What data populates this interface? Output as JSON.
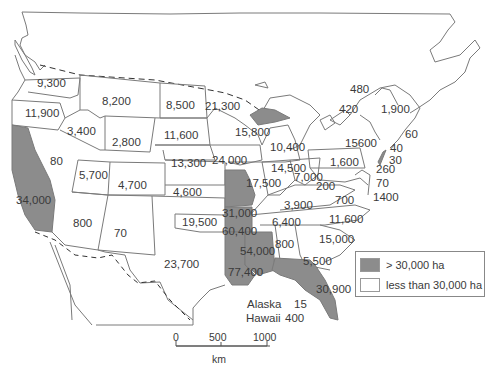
{
  "map": {
    "title": "",
    "colors": {
      "high": "#8c8c8c",
      "low": "#ffffff",
      "border": "#7a7a7a"
    },
    "state_values": [
      {
        "id": "wa",
        "value": "9,300",
        "x": 37,
        "y": 77
      },
      {
        "id": "or",
        "value": "11,900",
        "x": 25,
        "y": 107
      },
      {
        "id": "ca",
        "value": "34,000",
        "x": 16,
        "y": 194,
        "highlight": true
      },
      {
        "id": "id",
        "value": "3,400",
        "x": 67,
        "y": 125
      },
      {
        "id": "nv",
        "value": "80",
        "x": 50,
        "y": 155
      },
      {
        "id": "mt",
        "value": "8,200",
        "x": 102,
        "y": 95
      },
      {
        "id": "wy",
        "value": "2,800",
        "x": 112,
        "y": 136
      },
      {
        "id": "ut",
        "value": "5,700",
        "x": 79,
        "y": 169
      },
      {
        "id": "co",
        "value": "4,700",
        "x": 118,
        "y": 179
      },
      {
        "id": "az",
        "value": "800",
        "x": 73,
        "y": 217
      },
      {
        "id": "nm",
        "value": "70",
        "x": 114,
        "y": 227
      },
      {
        "id": "nd",
        "value": "8,500",
        "x": 166,
        "y": 99
      },
      {
        "id": "sd",
        "value": "11,600",
        "x": 164,
        "y": 129
      },
      {
        "id": "ne",
        "value": "13,300",
        "x": 171,
        "y": 157
      },
      {
        "id": "ks",
        "value": "4,600",
        "x": 173,
        "y": 186
      },
      {
        "id": "ok",
        "value": "19,500",
        "x": 182,
        "y": 216
      },
      {
        "id": "tx",
        "value": "23,700",
        "x": 164,
        "y": 258
      },
      {
        "id": "mn",
        "value": "21,300",
        "x": 205,
        "y": 100
      },
      {
        "id": "ia",
        "value": "24,000",
        "x": 212,
        "y": 154
      },
      {
        "id": "mo",
        "value": "31,000",
        "x": 222,
        "y": 207,
        "highlight": true
      },
      {
        "id": "ar",
        "value": "60,400",
        "x": 222,
        "y": 225,
        "highlight": true
      },
      {
        "id": "la",
        "value": "77,400",
        "x": 228,
        "y": 266,
        "highlight": true
      },
      {
        "id": "ms",
        "value": "54,000",
        "x": 240,
        "y": 245,
        "highlight": true
      },
      {
        "id": "wi",
        "value": "15,800",
        "x": 235,
        "y": 126
      },
      {
        "id": "il",
        "value": "17,500",
        "x": 246,
        "y": 177
      },
      {
        "id": "mi",
        "value": "10,400",
        "x": 270,
        "y": 141
      },
      {
        "id": "in",
        "value": "14,500",
        "x": 271,
        "y": 162
      },
      {
        "id": "oh",
        "value": "7,000",
        "x": 294,
        "y": 171
      },
      {
        "id": "ky",
        "value": "3,900",
        "x": 284,
        "y": 199
      },
      {
        "id": "tn",
        "value": "6,400",
        "x": 272,
        "y": 216
      },
      {
        "id": "al",
        "value": "800",
        "x": 275,
        "y": 238
      },
      {
        "id": "ga",
        "value": "5,500",
        "x": 303,
        "y": 255
      },
      {
        "id": "fl",
        "value": "30,900",
        "x": 316,
        "y": 283,
        "highlight": true
      },
      {
        "id": "sc",
        "value": "15,000",
        "x": 319,
        "y": 233
      },
      {
        "id": "nc",
        "value": "11,600",
        "x": 329,
        "y": 213
      },
      {
        "id": "va",
        "value": "700",
        "x": 335,
        "y": 194
      },
      {
        "id": "wv",
        "value": "200",
        "x": 316,
        "y": 180
      },
      {
        "id": "pa",
        "value": "1,600",
        "x": 330,
        "y": 156
      },
      {
        "id": "ny",
        "value": "15600",
        "x": 345,
        "y": 137
      },
      {
        "id": "vt",
        "value": "480",
        "x": 350,
        "y": 83
      },
      {
        "id": "nh",
        "value": "420",
        "x": 339,
        "y": 103
      },
      {
        "id": "me",
        "value": "1,900",
        "x": 381,
        "y": 103
      },
      {
        "id": "ma",
        "value": "60",
        "x": 405,
        "y": 128
      },
      {
        "id": "ri",
        "value": "40",
        "x": 390,
        "y": 142
      },
      {
        "id": "ct",
        "value": "30",
        "x": 389,
        "y": 154
      },
      {
        "id": "nj",
        "value": "260",
        "x": 376,
        "y": 163
      },
      {
        "id": "de",
        "value": "70",
        "x": 376,
        "y": 177
      },
      {
        "id": "md",
        "value": "1400",
        "x": 373,
        "y": 191
      }
    ],
    "extra": {
      "alaska_label": "Alaska",
      "alaska_value": "15",
      "hawaii_label": "Hawaii",
      "hawaii_value": "400"
    },
    "legend": {
      "items": [
        {
          "label": "> 30,000 ha",
          "color": "#8c8c8c"
        },
        {
          "label": "less than 30,000 ha",
          "color": "#ffffff"
        }
      ]
    },
    "scale": {
      "ticks": [
        "0",
        "500",
        "1000"
      ],
      "unit": "km"
    }
  }
}
